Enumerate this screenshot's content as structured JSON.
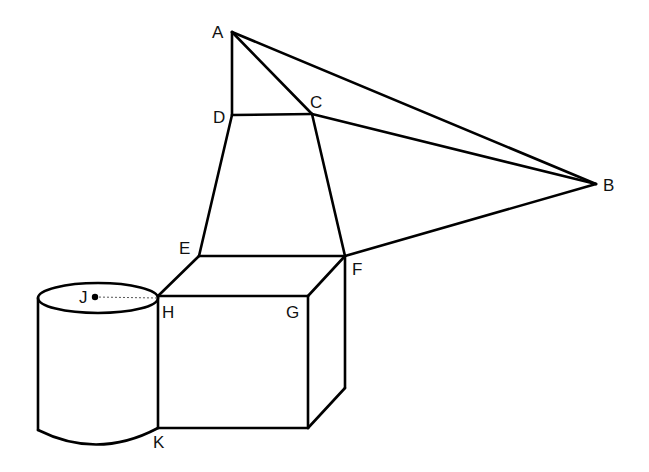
{
  "diagram": {
    "type": "geometry-figure",
    "points": {
      "A": {
        "label": "A",
        "x": 232,
        "y": 32,
        "lx": 212,
        "ly": 38
      },
      "B": {
        "label": "B",
        "x": 596,
        "y": 184,
        "lx": 603,
        "ly": 191
      },
      "C": {
        "label": "C",
        "x": 312,
        "y": 114,
        "lx": 310,
        "ly": 108
      },
      "D": {
        "label": "D",
        "x": 232,
        "y": 115,
        "lx": 213,
        "ly": 123
      },
      "E": {
        "label": "E",
        "x": 199,
        "y": 256,
        "lx": 179,
        "ly": 254
      },
      "F": {
        "label": "F",
        "x": 345,
        "y": 256,
        "lx": 352,
        "ly": 275
      },
      "G": {
        "label": "G",
        "x": 308,
        "y": 296,
        "lx": 286,
        "ly": 318
      },
      "H": {
        "label": "H",
        "x": 158,
        "y": 296,
        "lx": 162,
        "ly": 318
      },
      "J": {
        "label": "J",
        "x": 95,
        "y": 296,
        "lx": 79,
        "ly": 303
      },
      "K": {
        "label": "K",
        "x": 158,
        "y": 428,
        "lx": 153,
        "ly": 448
      }
    },
    "edges": [
      [
        "A",
        "D"
      ],
      [
        "A",
        "C"
      ],
      [
        "A",
        "B"
      ],
      [
        "D",
        "C"
      ],
      [
        "C",
        "B"
      ],
      [
        "D",
        "E"
      ],
      [
        "C",
        "F"
      ],
      [
        "E",
        "F"
      ],
      [
        "F",
        "B"
      ],
      [
        "E",
        "H"
      ],
      [
        "F",
        "G"
      ],
      [
        "H",
        "G"
      ],
      [
        "H",
        "K"
      ],
      [
        "G",
        "front-bottom-right"
      ],
      [
        "K",
        "front-bottom-right"
      ],
      [
        "front-bottom-right",
        "back-bottom-right"
      ],
      [
        "F",
        "back-bottom-right"
      ]
    ],
    "cylinder": {
      "center_top": "J",
      "radius_point": "H"
    },
    "colors": {
      "stroke": "#000000",
      "background": "#ffffff"
    }
  }
}
